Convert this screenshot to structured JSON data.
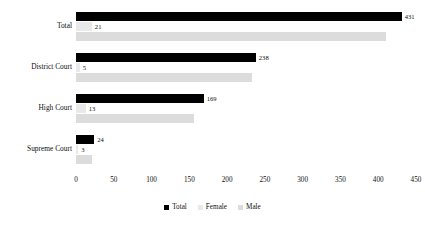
{
  "chart_data": {
    "type": "bar",
    "orientation": "horizontal",
    "title": "",
    "xlabel": "",
    "ylabel": "",
    "xlim": [
      0,
      450
    ],
    "xticks": [
      0,
      50,
      100,
      150,
      200,
      250,
      300,
      350,
      400,
      450
    ],
    "grid": false,
    "legend_position": "bottom",
    "categories": [
      "Total",
      "District Court",
      "High Court",
      "Supreme Court"
    ],
    "series": [
      {
        "name": "Total",
        "color": "#000000",
        "values": [
          431,
          238,
          169,
          24
        ],
        "labels": [
          "431",
          "238",
          "169",
          "24"
        ]
      },
      {
        "name": "Female",
        "color": "#e9e9e9",
        "values": [
          21,
          5,
          13,
          3
        ],
        "labels": [
          "21",
          "5",
          "13",
          "3"
        ]
      },
      {
        "name": "Male",
        "color": "#dcdcdc",
        "values": [
          410,
          233,
          156,
          21
        ],
        "labels": [
          "",
          "",
          "",
          ""
        ]
      }
    ]
  },
  "legend": [
    {
      "label": "Total"
    },
    {
      "label": "Female"
    },
    {
      "label": "Male"
    }
  ]
}
